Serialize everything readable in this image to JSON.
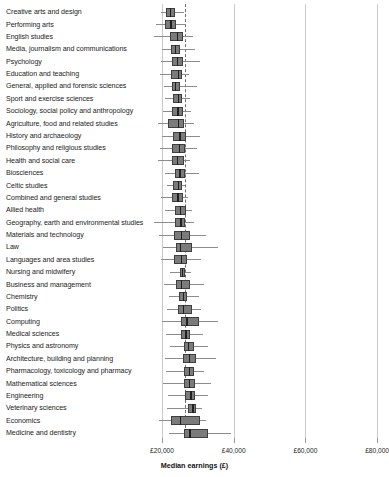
{
  "chart_data": {
    "type": "box",
    "title": "",
    "xlabel": "Median earnings (£)",
    "ylabel": "",
    "xlim": [
      11000,
      83000
    ],
    "xticks": [
      20000,
      40000,
      60000,
      80000
    ],
    "xtick_labels": [
      "£20,000",
      "£40,000",
      "£60,000",
      "£80,000"
    ],
    "grid": true,
    "reference_line": 26500,
    "legend": "",
    "colors": {
      "box_fill": "#7b7b7b",
      "box_edge": "#3f3f3f",
      "median": "#1f1f1f",
      "whisker": "#8c8c8c",
      "gridline": "#c9c9c9",
      "reference_line": "#6e6e6e"
    },
    "categories": [
      "Creative arts and design",
      "Performing arts",
      "English studies",
      "Media, journalism and communications",
      "Psychology",
      "Education and teaching",
      "General, applied and forensic sciences",
      "Sport and exercise sciences",
      "Sociology, social policy and anthropology",
      "Agriculture, food and related studies",
      "History and archaeology",
      "Philosophy and religious studies",
      "Health and social care",
      "Biosciences",
      "Celtic studies",
      "Combined and general studies",
      "Allied health",
      "Geography, earth and environmental studies",
      "Materials and technology",
      "Law",
      "Languages and area studies",
      "Nursing and midwifery",
      "Business and management",
      "Chemistry",
      "Politics",
      "Computing",
      "Medical sciences",
      "Physics and astronomy",
      "Architecture, building and planning",
      "Pharmacology, toxicology and pharmacy",
      "Mathematical sciences",
      "Engineering",
      "Veterinary sciences",
      "Economics",
      "Medicine and dentistry"
    ],
    "boxes": [
      {
        "category": "Creative arts and design",
        "whisker_low": 19800,
        "q1": 21000,
        "median": 22100,
        "q3": 23500,
        "whisker_high": 26200
      },
      {
        "category": "Performing arts",
        "whisker_low": 18400,
        "q1": 20800,
        "median": 22300,
        "q3": 24000,
        "whisker_high": 26600
      },
      {
        "category": "English studies",
        "whisker_low": 17900,
        "q1": 22300,
        "median": 24100,
        "q3": 25900,
        "whisker_high": 28600
      },
      {
        "category": "Media, journalism and communications",
        "whisker_low": 20000,
        "q1": 22400,
        "median": 23600,
        "q3": 25100,
        "whisker_high": 29100
      },
      {
        "category": "Psychology",
        "whisker_low": 19700,
        "q1": 22700,
        "median": 24200,
        "q3": 25800,
        "whisker_high": 30500
      },
      {
        "category": "Education and teaching",
        "whisker_low": 19500,
        "q1": 22500,
        "median": 24400,
        "q3": 25600,
        "whisker_high": 27600
      },
      {
        "category": "General, applied and forensic sciences",
        "whisker_low": 20600,
        "q1": 22700,
        "median": 23600,
        "q3": 24900,
        "whisker_high": 29800
      },
      {
        "category": "Sport and exercise sciences",
        "whisker_low": 20700,
        "q1": 23100,
        "median": 24400,
        "q3": 25600,
        "whisker_high": 27900
      },
      {
        "category": "Sociology, social policy and anthropology",
        "whisker_low": 20400,
        "q1": 22800,
        "median": 24300,
        "q3": 25900,
        "whisker_high": 28200
      },
      {
        "category": "Agriculture, food and related studies",
        "whisker_low": 18900,
        "q1": 21700,
        "median": 24500,
        "q3": 26200,
        "whisker_high": 29000
      },
      {
        "category": "History and archaeology",
        "whisker_low": 20000,
        "q1": 23000,
        "median": 24800,
        "q3": 26600,
        "whisker_high": 30700
      },
      {
        "category": "Philosophy and religious studies",
        "whisker_low": 19400,
        "q1": 22900,
        "median": 24700,
        "q3": 26500,
        "whisker_high": 29800
      },
      {
        "category": "Health and social care",
        "whisker_low": 18900,
        "q1": 22700,
        "median": 24200,
        "q3": 26200,
        "whisker_high": 27800
      },
      {
        "category": "Biosciences",
        "whisker_low": 20800,
        "q1": 23500,
        "median": 24800,
        "q3": 26300,
        "whisker_high": 30400
      },
      {
        "category": "Celtic studies",
        "whisker_low": 21300,
        "q1": 23000,
        "median": 24400,
        "q3": 25500,
        "whisker_high": 26400
      },
      {
        "category": "Combined and general studies",
        "whisker_low": 19700,
        "q1": 22800,
        "median": 24300,
        "q3": 25900,
        "whisker_high": 27200
      },
      {
        "category": "Allied health",
        "whisker_low": 20800,
        "q1": 23500,
        "median": 25000,
        "q3": 26600,
        "whisker_high": 28500
      },
      {
        "category": "Geography, earth and environmental studies",
        "whisker_low": 17700,
        "q1": 23700,
        "median": 25100,
        "q3": 26500,
        "whisker_high": 28800
      },
      {
        "category": "Materials and technology",
        "whisker_low": 19200,
        "q1": 23300,
        "median": 25200,
        "q3": 27700,
        "whisker_high": 32200
      },
      {
        "category": "Law",
        "whisker_low": 20300,
        "q1": 23900,
        "median": 25000,
        "q3": 28300,
        "whisker_high": 35500
      },
      {
        "category": "Languages and area studies",
        "whisker_low": 19800,
        "q1": 23400,
        "median": 25300,
        "q3": 27100,
        "whisker_high": 30800
      },
      {
        "category": "Nursing and midwifery",
        "whisker_low": 22100,
        "q1": 25000,
        "median": 25600,
        "q3": 26300,
        "whisker_high": 28000
      },
      {
        "category": "Business and management",
        "whisker_low": 20600,
        "q1": 24000,
        "median": 25300,
        "q3": 27900,
        "whisker_high": 31800
      },
      {
        "category": "Chemistry",
        "whisker_low": 21900,
        "q1": 24700,
        "median": 25900,
        "q3": 26900,
        "whisker_high": 30400
      },
      {
        "category": "Politics",
        "whisker_low": 21400,
        "q1": 24400,
        "median": 25900,
        "q3": 28400,
        "whisker_high": 31000
      },
      {
        "category": "Computing",
        "whisker_low": 20100,
        "q1": 25300,
        "median": 26800,
        "q3": 30200,
        "whisker_high": 35600
      },
      {
        "category": "Medical sciences",
        "whisker_low": 21000,
        "q1": 25200,
        "median": 26500,
        "q3": 27800,
        "whisker_high": 31300
      },
      {
        "category": "Physics and astronomy",
        "whisker_low": 22100,
        "q1": 26000,
        "median": 27300,
        "q3": 28900,
        "whisker_high": 32900
      },
      {
        "category": "Architecture, building and planning",
        "whisker_low": 20800,
        "q1": 25900,
        "median": 27500,
        "q3": 29600,
        "whisker_high": 35200
      },
      {
        "category": "Pharmacology, toxicology and pharmacy",
        "whisker_low": 21200,
        "q1": 26100,
        "median": 27500,
        "q3": 29000,
        "whisker_high": 31600
      },
      {
        "category": "Mathematical sciences",
        "whisker_low": 20300,
        "q1": 26000,
        "median": 27400,
        "q3": 29100,
        "whisker_high": 33700
      },
      {
        "category": "Engineering",
        "whisker_low": 21700,
        "q1": 26400,
        "median": 27900,
        "q3": 29300,
        "whisker_high": 32700
      },
      {
        "category": "Veterinary sciences",
        "whisker_low": 21400,
        "q1": 27200,
        "median": 28500,
        "q3": 29500,
        "whisker_high": 31100
      },
      {
        "category": "Economics",
        "whisker_low": 19100,
        "q1": 22600,
        "median": 24900,
        "q3": 30700,
        "whisker_high": 32200
      },
      {
        "category": "Medicine and dentistry",
        "whisker_low": 22000,
        "q1": 26200,
        "median": 27600,
        "q3": 32800,
        "whisker_high": 39300
      }
    ]
  },
  "axis": {
    "title": "Median earnings (£)",
    "ticks": [
      {
        "value": 20000,
        "label": "£20,000"
      },
      {
        "value": 40000,
        "label": "£40,000"
      },
      {
        "value": 60000,
        "label": "£60,000"
      },
      {
        "value": 80000,
        "label": "£80,000"
      }
    ]
  }
}
